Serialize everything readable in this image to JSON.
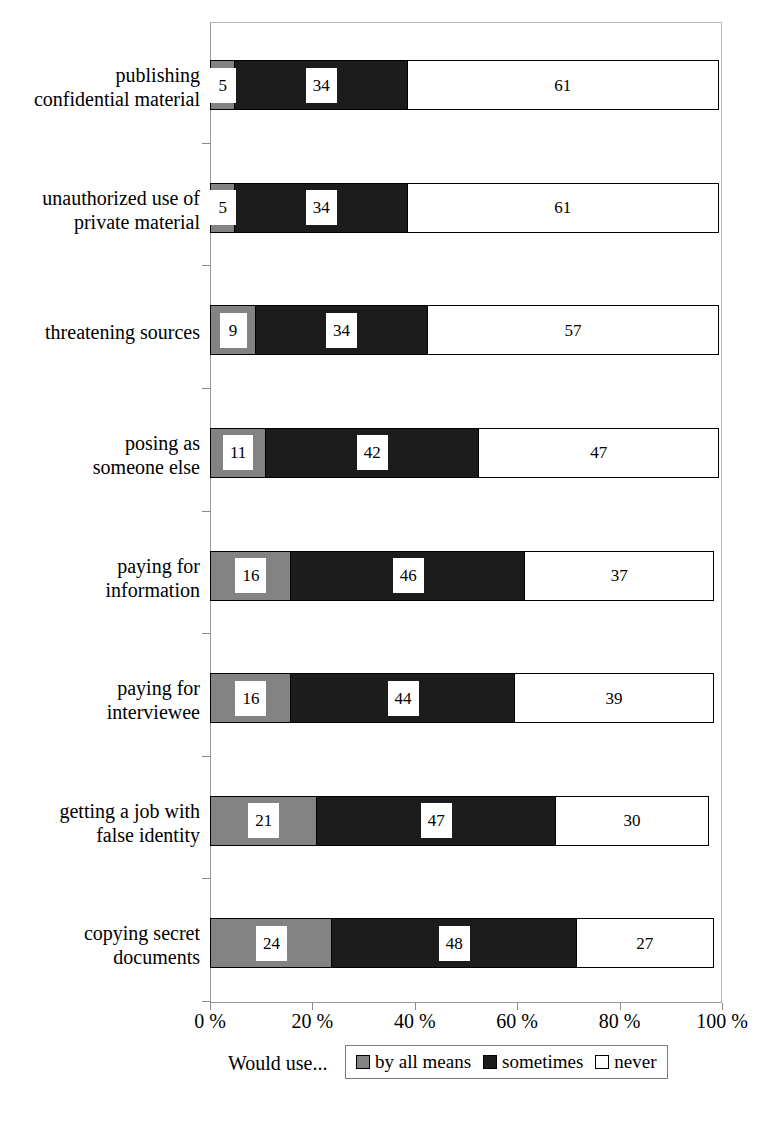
{
  "chart_data": {
    "type": "bar",
    "orientation": "horizontal",
    "stacked": true,
    "title": "",
    "xlabel": "",
    "ylabel": "",
    "xlim": [
      0,
      100
    ],
    "grid": false,
    "legend_position": "bottom",
    "legend_title": "Would use...",
    "categories": [
      "publishing confidential material",
      "unauthorized use of private material",
      "threatening sources",
      "posing as someone else",
      "paying for information",
      "paying for interviewee",
      "getting a job with false identity",
      "copying secret documents"
    ],
    "category_lines": [
      [
        "publishing",
        "confidential material"
      ],
      [
        "unauthorized use of",
        "private material"
      ],
      [
        "threatening sources"
      ],
      [
        "posing as",
        "someone else"
      ],
      [
        "paying for",
        "information"
      ],
      [
        "paying for",
        "interviewee"
      ],
      [
        "getting a job with",
        "false identity"
      ],
      [
        "copying secret",
        "documents"
      ]
    ],
    "series": [
      {
        "name": "by all means",
        "color": "#838383",
        "values": [
          5,
          5,
          9,
          11,
          16,
          16,
          21,
          24
        ]
      },
      {
        "name": "sometimes",
        "color": "#1c1c1c",
        "values": [
          34,
          34,
          34,
          42,
          46,
          44,
          47,
          48
        ]
      },
      {
        "name": "never",
        "color": "#ffffff",
        "values": [
          61,
          61,
          57,
          47,
          37,
          39,
          30,
          27
        ]
      }
    ],
    "xticks": [
      0,
      20,
      40,
      60,
      80,
      100
    ],
    "xtick_labels": [
      "0 %",
      "20 %",
      "40 %",
      "60 %",
      "80 %",
      "100 %"
    ]
  },
  "legend": {
    "label": "Would use...",
    "entries": [
      {
        "swatch": "by-all-means-swatch",
        "text": "by all means"
      },
      {
        "swatch": "sometimes-swatch",
        "text": "sometimes"
      },
      {
        "swatch": "never-swatch",
        "text": "never"
      }
    ]
  }
}
